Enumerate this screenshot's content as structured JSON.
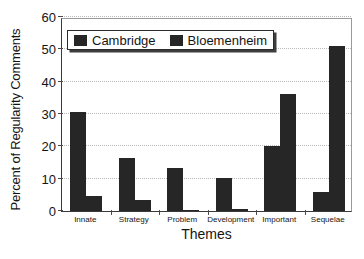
{
  "chart_data": {
    "type": "bar",
    "title": "",
    "xlabel": "Themes",
    "ylabel": "Percent of Regularity Comments",
    "categories": [
      "Innate",
      "Strategy",
      "Problem",
      "Development",
      "Important",
      "Sequelae"
    ],
    "series": [
      {
        "name": "Cambridge",
        "color": "#262626",
        "values": [
          30.5,
          16.5,
          13.4,
          10.3,
          20.2,
          6.0
        ]
      },
      {
        "name": "Bloemenheim",
        "color": "#262626",
        "values": [
          4.7,
          3.5,
          0.4,
          0.5,
          36.1,
          51.1
        ]
      }
    ],
    "ylim": [
      0,
      60
    ],
    "yticks": [
      0,
      10,
      20,
      30,
      40,
      50,
      60
    ],
    "ytick_labels": [
      "0",
      "10",
      "20",
      "30",
      "40",
      "50",
      "60"
    ],
    "grid": "horizontal-dotted",
    "legend_position": "top-left-inside",
    "axis_color": "#3a3a3a",
    "grid_color": "#b9b9b9",
    "background": "#ffffff"
  },
  "legend": {
    "entries": [
      {
        "label": "Cambridge",
        "swatch": "legend-swatch-cambridge"
      },
      {
        "label": "Bloemenheim",
        "swatch": "legend-swatch-bloemenheim"
      }
    ]
  }
}
